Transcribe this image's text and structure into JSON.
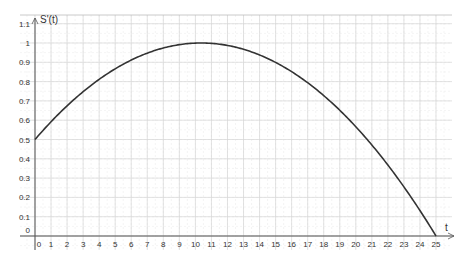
{
  "chart_data": {
    "type": "line",
    "title": "",
    "xlabel": "t",
    "ylabel": "S'(t)",
    "xlim": [
      0,
      25
    ],
    "ylim": [
      0,
      1.1
    ],
    "x_ticks": [
      "0",
      "1",
      "2",
      "3",
      "4",
      "5",
      "6",
      "7",
      "8",
      "9",
      "10",
      "11",
      "12",
      "13",
      "14",
      "15",
      "16",
      "17",
      "18",
      "19",
      "20",
      "21",
      "22",
      "23",
      "24",
      "25"
    ],
    "y_ticks": [
      "0",
      "0.1",
      "0.2",
      "0.3",
      "0.4",
      "0.5",
      "0.6",
      "0.7",
      "0.8",
      "0.9",
      "1",
      "1.1"
    ],
    "grid": true,
    "legend": null,
    "series": [
      {
        "name": "S'(t)",
        "color": "#333333",
        "x": [
          0,
          1,
          2,
          3,
          4,
          5,
          6,
          7,
          8,
          9,
          10,
          11,
          12,
          13,
          14,
          15,
          16,
          17,
          18,
          19,
          20,
          21,
          22,
          23,
          24,
          25
        ],
        "values": [
          0.5,
          0.59,
          0.67,
          0.74,
          0.81,
          0.87,
          0.92,
          0.95,
          0.98,
          0.99,
          1.0,
          1.0,
          0.99,
          0.97,
          0.94,
          0.9,
          0.85,
          0.79,
          0.72,
          0.64,
          0.55,
          0.46,
          0.35,
          0.24,
          0.12,
          0.0
        ]
      }
    ]
  },
  "axes": {
    "x_label": "t",
    "y_label": "S'(t)"
  }
}
